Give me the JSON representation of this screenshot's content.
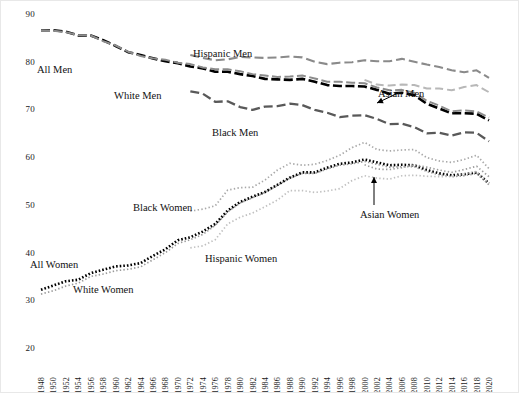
{
  "chart_data": {
    "type": "line",
    "title": "",
    "xlabel": "",
    "ylabel": "",
    "xlim": [
      1948,
      2020
    ],
    "ylim": [
      20,
      90
    ],
    "yticks": [
      20,
      30,
      40,
      50,
      60,
      70,
      80,
      90
    ],
    "grid": false,
    "legend_position": "inline-annotations",
    "x": [
      1948,
      1950,
      1952,
      1954,
      1956,
      1958,
      1960,
      1962,
      1964,
      1966,
      1968,
      1970,
      1972,
      1974,
      1976,
      1978,
      1980,
      1982,
      1984,
      1986,
      1988,
      1990,
      1992,
      1994,
      1996,
      1998,
      2000,
      2002,
      2004,
      2006,
      2008,
      2010,
      2012,
      2014,
      2016,
      2018,
      2020
    ],
    "series": [
      {
        "name": "All Men",
        "style": "dashed-black-thick",
        "color": "#000000",
        "values": [
          86.6,
          86.6,
          86.3,
          85.5,
          85.5,
          84.5,
          83.3,
          82.0,
          81.4,
          80.7,
          80.1,
          79.7,
          79.0,
          78.6,
          77.9,
          77.9,
          77.4,
          77.0,
          76.4,
          76.3,
          76.2,
          76.4,
          75.8,
          75.1,
          74.9,
          74.9,
          74.8,
          74.1,
          73.3,
          73.5,
          73.0,
          71.2,
          70.2,
          69.2,
          69.2,
          69.1,
          67.7
        ]
      },
      {
        "name": "White Men",
        "style": "dashed-gray",
        "color": "#8c8c8c",
        "values": [
          86.6,
          86.5,
          86.2,
          85.6,
          85.5,
          84.3,
          83.4,
          82.1,
          81.2,
          80.7,
          80.4,
          79.8,
          79.5,
          78.8,
          78.4,
          78.4,
          78.0,
          77.4,
          77.1,
          76.8,
          76.9,
          77.1,
          76.5,
          75.8,
          75.8,
          75.6,
          75.5,
          74.6,
          74.0,
          74.1,
          73.5,
          71.8,
          70.8,
          69.6,
          69.8,
          69.6,
          68.3
        ]
      },
      {
        "name": "Black Men",
        "style": "dashed-darkgray",
        "color": "#595959",
        "values": [
          null,
          null,
          null,
          null,
          null,
          null,
          null,
          null,
          null,
          null,
          null,
          null,
          73.8,
          73.3,
          71.6,
          71.7,
          70.5,
          69.9,
          70.6,
          70.7,
          71.2,
          70.9,
          69.9,
          69.3,
          68.4,
          68.7,
          68.8,
          68.0,
          66.9,
          67.0,
          66.3,
          65.0,
          65.1,
          64.5,
          65.2,
          65.1,
          63.3
        ]
      },
      {
        "name": "Hispanic Men",
        "style": "dashed-gray-light",
        "color": "#8a8a8a",
        "values": [
          null,
          null,
          null,
          null,
          null,
          null,
          null,
          null,
          null,
          null,
          null,
          null,
          81.4,
          80.8,
          80.3,
          80.5,
          81.0,
          80.9,
          80.8,
          80.9,
          81.1,
          80.9,
          80.0,
          79.5,
          79.8,
          79.9,
          80.3,
          80.1,
          80.1,
          80.6,
          80.0,
          79.4,
          78.9,
          78.2,
          77.8,
          78.2,
          76.6
        ]
      },
      {
        "name": "Asian Men",
        "style": "dashed-lightgray",
        "color": "#b8b8b8",
        "values": [
          null,
          null,
          null,
          null,
          null,
          null,
          null,
          null,
          null,
          null,
          null,
          null,
          null,
          null,
          null,
          null,
          null,
          null,
          null,
          null,
          null,
          null,
          null,
          null,
          null,
          null,
          76.2,
          75.2,
          75.0,
          75.2,
          75.1,
          74.4,
          74.4,
          74.0,
          74.7,
          75.1,
          73.6
        ]
      },
      {
        "name": "All Women",
        "style": "dotted-black-bold",
        "color": "#000000",
        "values": [
          32.2,
          33.1,
          34.0,
          34.3,
          35.7,
          36.4,
          37.1,
          37.3,
          37.8,
          39.3,
          40.7,
          42.6,
          43.2,
          44.4,
          46.0,
          48.8,
          50.6,
          51.7,
          52.7,
          54.2,
          55.7,
          56.8,
          56.8,
          57.8,
          58.6,
          58.9,
          59.5,
          58.9,
          58.3,
          58.4,
          58.3,
          57.3,
          56.6,
          56.2,
          56.4,
          56.8,
          54.5
        ]
      },
      {
        "name": "White Women",
        "style": "dotted-gray",
        "color": "#9a9a9a",
        "values": [
          31.3,
          32.0,
          33.0,
          33.6,
          35.0,
          35.5,
          36.2,
          36.5,
          37.0,
          38.5,
          40.0,
          41.9,
          42.7,
          43.8,
          45.7,
          48.5,
          50.4,
          51.5,
          52.6,
          54.1,
          55.6,
          56.6,
          56.6,
          57.5,
          58.3,
          58.6,
          59.1,
          58.5,
          57.9,
          58.0,
          58.0,
          57.0,
          56.3,
          55.9,
          56.1,
          56.6,
          54.2
        ]
      },
      {
        "name": "Black Women",
        "style": "dotted-gray-light",
        "color": "#a8a8a8",
        "values": [
          null,
          null,
          null,
          null,
          null,
          null,
          null,
          null,
          null,
          null,
          null,
          null,
          48.7,
          49.1,
          49.8,
          53.1,
          53.6,
          53.7,
          55.2,
          57.3,
          58.7,
          58.3,
          58.5,
          59.3,
          60.4,
          62.0,
          63.1,
          61.6,
          61.3,
          61.5,
          61.6,
          59.9,
          59.2,
          58.9,
          59.5,
          60.4,
          57.6
        ]
      },
      {
        "name": "Hispanic Women",
        "style": "dotted-lightgray",
        "color": "#c0c0c0",
        "values": [
          null,
          null,
          null,
          null,
          null,
          null,
          null,
          null,
          null,
          null,
          null,
          null,
          41.0,
          41.4,
          42.7,
          46.0,
          47.4,
          48.3,
          49.6,
          51.0,
          53.0,
          53.0,
          52.6,
          52.9,
          53.4,
          55.1,
          56.1,
          55.6,
          55.4,
          56.1,
          56.2,
          56.0,
          55.9,
          56.0,
          56.5,
          57.0,
          54.5
        ]
      },
      {
        "name": "Asian Women",
        "style": "dotted-gray-mid",
        "color": "#9c9c9c",
        "values": [
          null,
          null,
          null,
          null,
          null,
          null,
          null,
          null,
          null,
          null,
          null,
          null,
          null,
          null,
          null,
          null,
          null,
          null,
          null,
          null,
          null,
          null,
          null,
          null,
          null,
          null,
          58.4,
          57.5,
          57.4,
          57.8,
          58.4,
          57.9,
          57.3,
          56.8,
          57.4,
          58.1,
          55.9
        ]
      }
    ],
    "annotations": [
      {
        "text": "All Men",
        "x_px": 36,
        "y_px": 63,
        "arrow": false
      },
      {
        "text": "White Men",
        "x_px": 113,
        "y_px": 89,
        "arrow": false
      },
      {
        "text": "Hispanic Men",
        "x_px": 192,
        "y_px": 47,
        "arrow": false
      },
      {
        "text": "Black Men",
        "x_px": 211,
        "y_px": 126,
        "arrow": false
      },
      {
        "text": "Asian Men",
        "x_px": 377,
        "y_px": 87,
        "arrow": true
      },
      {
        "text": "All Women",
        "x_px": 29,
        "y_px": 258,
        "arrow": false
      },
      {
        "text": "White Women",
        "x_px": 72,
        "y_px": 283,
        "arrow": false
      },
      {
        "text": "Black Women",
        "x_px": 132,
        "y_px": 201,
        "arrow": false
      },
      {
        "text": "Hispanic Women",
        "x_px": 204,
        "y_px": 252,
        "arrow": false
      },
      {
        "text": "Asian Women",
        "x_px": 359,
        "y_px": 208,
        "arrow": true
      }
    ]
  },
  "axes": {
    "y_tick_labels": [
      "90",
      "80",
      "70",
      "60",
      "50",
      "40",
      "30",
      "20"
    ],
    "x_tick_labels": [
      "1948",
      "1950",
      "1952",
      "1954",
      "1956",
      "1958",
      "1960",
      "1962",
      "1964",
      "1966",
      "1968",
      "1970",
      "1972",
      "1974",
      "1976",
      "1978",
      "1980",
      "1982",
      "1984",
      "1986",
      "1988",
      "1990",
      "1992",
      "1994",
      "1996",
      "1998",
      "2000",
      "2002",
      "2004",
      "2006",
      "2008",
      "2010",
      "2012",
      "2014",
      "2016",
      "2018",
      "2020"
    ]
  }
}
